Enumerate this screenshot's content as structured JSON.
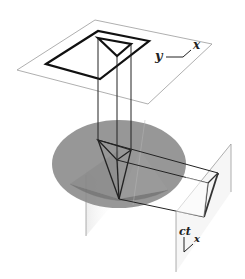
{
  "diagram": {
    "top_plane": {
      "axis_labels": {
        "y": "y",
        "x": "x"
      }
    },
    "side_plane": {
      "axis_labels": {
        "ct": "ct",
        "x": "x"
      }
    },
    "colors": {
      "cone_fill": "#8a8a8a",
      "disk_fill": "#8c8c8c",
      "plane_stroke": "#9a9a9a",
      "shape_stroke": "#111111",
      "side_plane_fill": "#f2f2f2",
      "background": "#ffffff"
    }
  }
}
